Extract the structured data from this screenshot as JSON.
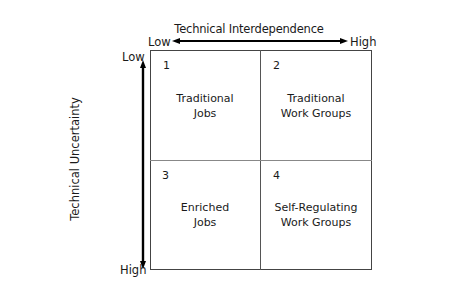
{
  "diagram": {
    "type": "2x2-matrix",
    "x_axis": {
      "title": "Technical Interdependence",
      "low_label": "Low",
      "high_label": "High",
      "direction": "left-to-right"
    },
    "y_axis": {
      "title": "Technical Uncertainty",
      "low_label": "Low",
      "high_label": "High",
      "direction": "top-to-bottom"
    },
    "quadrants": [
      {
        "number": "1",
        "line1": "Traditional",
        "line2": "Jobs",
        "position": "top-left"
      },
      {
        "number": "2",
        "line1": "Traditional",
        "line2": "Work Groups",
        "position": "top-right"
      },
      {
        "number": "3",
        "line1": "Enriched",
        "line2": "Jobs",
        "position": "bottom-left"
      },
      {
        "number": "4",
        "line1": "Self-Regulating",
        "line2": "Work Groups",
        "position": "bottom-right"
      }
    ],
    "colors": {
      "text": "#1a1a1a",
      "border": "#444444",
      "arrow": "#000000",
      "background": "#ffffff"
    }
  }
}
